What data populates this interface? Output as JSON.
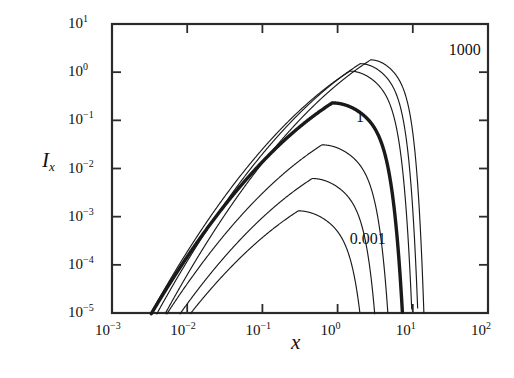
{
  "chart_data": {
    "type": "line",
    "title": "",
    "xlabel": "x",
    "ylabel": "I_x",
    "xscale": "log",
    "yscale": "log",
    "xlim": [
      0.001,
      100
    ],
    "ylim": [
      1e-05,
      10
    ],
    "grid": false,
    "legend": "none",
    "x_tick_labels": [
      "10-3",
      "10-2",
      "10-1",
      "100",
      "101",
      "102"
    ],
    "x_tick_values": [
      0.001,
      0.01,
      0.1,
      1,
      10,
      100
    ],
    "y_tick_labels": [
      "10-5",
      "10-4",
      "10-3",
      "10-2",
      "10-1",
      "100",
      "101"
    ],
    "y_tick_values": [
      1e-05,
      0.0001,
      0.001,
      0.01,
      0.1,
      1,
      10
    ],
    "annotations": [
      {
        "text": "1000",
        "x": 30.0,
        "y": 2.6
      },
      {
        "text": "1",
        "x": 1.75,
        "y": 0.105
      },
      {
        "text": "0.001",
        "x": 1.45,
        "y": 0.00032
      }
    ],
    "series": [
      {
        "name": "0.001",
        "parameter": 0.001,
        "peak_x": 0.3,
        "peak_y": 0.00132,
        "cutoff_x": 3.3,
        "emphasis": false
      },
      {
        "name": "0.01",
        "parameter": 0.01,
        "peak_x": 0.46,
        "peak_y": 0.0062,
        "cutoff_x": 4.6,
        "emphasis": false
      },
      {
        "name": "0.1",
        "parameter": 0.1,
        "peak_x": 0.62,
        "peak_y": 0.031,
        "cutoff_x": 6.4,
        "emphasis": false
      },
      {
        "name": "1",
        "parameter": 1,
        "peak_x": 0.85,
        "peak_y": 0.23,
        "cutoff_x": 9.3,
        "emphasis": true
      },
      {
        "name": "10",
        "parameter": 10,
        "peak_x": 1.45,
        "peak_y": 1.05,
        "cutoff_x": 11.5,
        "emphasis": false
      },
      {
        "name": "100",
        "parameter": 100,
        "peak_x": 2.0,
        "peak_y": 1.5,
        "cutoff_x": 13.5,
        "emphasis": false
      },
      {
        "name": "1000",
        "parameter": 1000,
        "peak_x": 2.75,
        "peak_y": 1.8,
        "cutoff_x": 16.0,
        "emphasis": false
      }
    ],
    "colors": {
      "curve": "#1a1a1a",
      "axis": "#2b2b2b",
      "background": "#ffffff"
    }
  }
}
